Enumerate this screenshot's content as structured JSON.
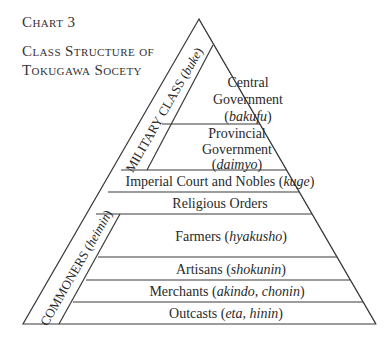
{
  "caption": {
    "label": "Chart 3",
    "title_line1": "Class Structure of",
    "title_line2": "Tokugawa Socety"
  },
  "pyramid": {
    "military_group": {
      "label": "MILITARY CLASS",
      "term": "buke"
    },
    "commoners_group": {
      "label": "COMMONERS",
      "term": "heimin"
    },
    "levels": [
      {
        "name": "Central",
        "name2": "Government",
        "term": "bakufu"
      },
      {
        "name": "Provincial",
        "name2": "Government",
        "term": "daimyo"
      },
      {
        "name": "Imperial Court and Nobles",
        "term": "kuge"
      },
      {
        "name": "Religious Orders"
      },
      {
        "name": "Farmers",
        "term": "hyakusho"
      },
      {
        "name": "Artisans",
        "term": "shokunin"
      },
      {
        "name": "Merchants",
        "term": "akindo, chonin"
      },
      {
        "name": "Outcasts",
        "term": "eta, hinin"
      }
    ],
    "line_color": "#3a3a3a"
  }
}
